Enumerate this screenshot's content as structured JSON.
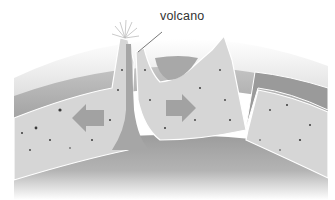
{
  "diagram": {
    "type": "geological-cross-section",
    "labels": {
      "volcano": "volcano"
    },
    "elements": [
      {
        "name": "atmosphere-band",
        "description": "curved light outer band"
      },
      {
        "name": "ocean-layer",
        "description": "mid-gray water layer above crust"
      },
      {
        "name": "crust",
        "description": "speckled light gray rock"
      },
      {
        "name": "mantle-plume-left",
        "description": "rising plume forming volcano peak"
      },
      {
        "name": "mantle-plume-right",
        "description": "rising plume forming mountain peak"
      },
      {
        "name": "arrow-left",
        "description": "arrow pointing left"
      },
      {
        "name": "arrow-right",
        "description": "arrow pointing right"
      },
      {
        "name": "subduction-trench",
        "description": "crust plunging downward on right"
      }
    ],
    "colors": {
      "background": "#ffffff",
      "atmosphere": "#e6e6e6",
      "ocean": "#a9a9a9",
      "crust": "#d6d6d6",
      "mantle": "#9a9a9a",
      "arrow": "#a2a2a2",
      "speckle": "#333333",
      "outline": "#ffffff"
    }
  }
}
